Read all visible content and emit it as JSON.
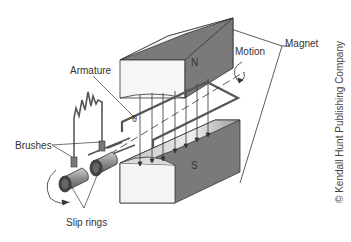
{
  "diagram": {
    "labels": {
      "armature": "Armature",
      "brushes": "Brushes",
      "slip_rings": "Slip rings",
      "motion": "Motion",
      "magnet": "Magnet",
      "north_pole": "N",
      "south_pole": "S",
      "angle": "θ"
    },
    "credit": "© Kendall Hunt Publishing Company",
    "colors": {
      "magnet_dark": "#707070",
      "magnet_light": "#f2f2f2",
      "line": "#333333",
      "coil": "#555555"
    }
  }
}
